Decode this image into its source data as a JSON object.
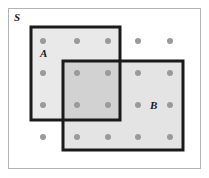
{
  "diagram": {
    "type": "venn-set-diagram",
    "background_color": "#ffffff",
    "universe": {
      "label": "S",
      "label_x": 14,
      "label_y": 21,
      "x": 8,
      "y": 8,
      "width": 192,
      "height": 160,
      "fill": "#ffffff",
      "stroke": "#b3b3b3",
      "stroke_width": 1
    },
    "sets": [
      {
        "name": "set-a",
        "label": "A",
        "label_x": 40,
        "label_y": 57,
        "x": 31,
        "y": 27,
        "width": 89,
        "height": 93,
        "fill": "#e9e9e9",
        "stroke": "#1a1a1a",
        "stroke_width": 3
      },
      {
        "name": "set-b",
        "label": "B",
        "label_x": 150,
        "label_y": 109,
        "x": 63,
        "y": 61,
        "width": 120,
        "height": 89,
        "fill": "#e4e4e4",
        "stroke": "#1a1a1a",
        "stroke_width": 3
      }
    ],
    "intersection": {
      "name": "intersection-a-b",
      "x": 63,
      "y": 61,
      "width": 57,
      "height": 59,
      "fill": "#d2d2d2"
    },
    "dot_grid": {
      "columns_x": [
        43,
        77,
        108,
        138,
        170
      ],
      "rows_y": [
        41,
        73,
        105,
        137
      ],
      "radius": 3,
      "color": "#9a9a9a",
      "count": 20
    },
    "elements": [
      {
        "x": 43,
        "y": 41,
        "region": "A only"
      },
      {
        "x": 77,
        "y": 41,
        "region": "A only"
      },
      {
        "x": 108,
        "y": 41,
        "region": "A only"
      },
      {
        "x": 138,
        "y": 41,
        "region": "S only"
      },
      {
        "x": 170,
        "y": 41,
        "region": "S only"
      },
      {
        "x": 43,
        "y": 73,
        "region": "A only"
      },
      {
        "x": 77,
        "y": 73,
        "region": "A and B"
      },
      {
        "x": 108,
        "y": 73,
        "region": "A and B"
      },
      {
        "x": 138,
        "y": 73,
        "region": "B only"
      },
      {
        "x": 170,
        "y": 73,
        "region": "B only"
      },
      {
        "x": 43,
        "y": 105,
        "region": "A only"
      },
      {
        "x": 77,
        "y": 105,
        "region": "A and B"
      },
      {
        "x": 108,
        "y": 105,
        "region": "A and B"
      },
      {
        "x": 138,
        "y": 105,
        "region": "B only"
      },
      {
        "x": 170,
        "y": 105,
        "region": "B only"
      },
      {
        "x": 43,
        "y": 137,
        "region": "S only"
      },
      {
        "x": 77,
        "y": 137,
        "region": "B only"
      },
      {
        "x": 108,
        "y": 137,
        "region": "B only"
      },
      {
        "x": 138,
        "y": 137,
        "region": "B only"
      },
      {
        "x": 170,
        "y": 137,
        "region": "B only"
      }
    ]
  }
}
